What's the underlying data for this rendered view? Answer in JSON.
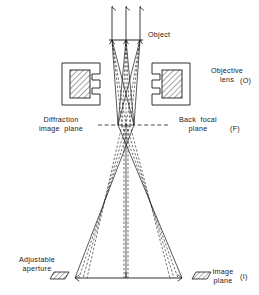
{
  "figure": {
    "background_color": "#ffffff",
    "line_color": "#1a1a1a",
    "width": 259,
    "height": 295
  },
  "labels": {
    "object": "Object",
    "objective_lens": "Objective\nlens",
    "objective_lens_tag": "(O)",
    "diffraction_image_plane": "Diffraction\nimage  plane",
    "back_focal_plane": "Back  focal\nplane",
    "back_focal_plane_tag": "(F)",
    "adjustable_aperture": "Adjustable\naperture",
    "image_plane": "Image\nplane",
    "image_plane_tag": "(I)"
  },
  "geometry": {
    "illumination_arrows": [
      {
        "x": 112,
        "y_top": 6,
        "y_bottom": 40
      },
      {
        "x": 126,
        "y_top": 6,
        "y_bottom": 40
      },
      {
        "x": 140,
        "y_top": 6,
        "y_bottom": 40
      }
    ],
    "object_plane": {
      "x1": 110,
      "x2": 142,
      "y": 40
    },
    "object_points": [
      112,
      126,
      140
    ],
    "pole_pieces": {
      "left": {
        "outer_x": 62,
        "outer_y": 63,
        "outer_w": 38,
        "outer_h": 42,
        "inner_x": 70,
        "inner_y": 70,
        "inner_w": 20,
        "inner_h": 28
      },
      "right": {
        "outer_x": 152,
        "outer_y": 63,
        "outer_w": 38,
        "outer_h": 42,
        "inner_x": 162,
        "inner_y": 70,
        "inner_w": 20,
        "inner_h": 28
      }
    },
    "back_focal_plane_line": {
      "x1": 100,
      "x2": 166,
      "y": 125,
      "style": "dashed"
    },
    "focal_crossings": [
      118,
      126,
      134
    ],
    "image_plane_line": {
      "x1": 75,
      "x2": 182,
      "y": 278
    },
    "image_points": [
      75,
      126,
      182
    ],
    "apertures": {
      "left": {
        "x": 50,
        "y": 272,
        "w": 19,
        "h": 7
      },
      "right": {
        "x": 188,
        "y": 272,
        "w": 19,
        "h": 7
      }
    },
    "ray_styles": {
      "solid": "solid",
      "dashed": "dashed"
    }
  },
  "ray_data": {
    "solid_rays": [
      {
        "from": 112,
        "focus": 118,
        "to": 182
      },
      {
        "from": 126,
        "focus": 118,
        "to": 182
      },
      {
        "from": 140,
        "focus": 118,
        "to": 182
      },
      {
        "from": 112,
        "focus": 134,
        "to": 75
      },
      {
        "from": 126,
        "focus": 134,
        "to": 75
      },
      {
        "from": 140,
        "focus": 134,
        "to": 75
      }
    ],
    "dashed_rays": [
      {
        "from": 112,
        "focus": 126,
        "to": 126
      },
      {
        "from": 126,
        "focus": 126,
        "to": 126
      },
      {
        "from": 140,
        "focus": 126,
        "to": 126
      },
      {
        "from": 112,
        "focus": 122,
        "to": 155
      },
      {
        "from": 126,
        "focus": 130,
        "to": 100
      },
      {
        "from": 140,
        "focus": 130,
        "to": 100
      }
    ]
  }
}
